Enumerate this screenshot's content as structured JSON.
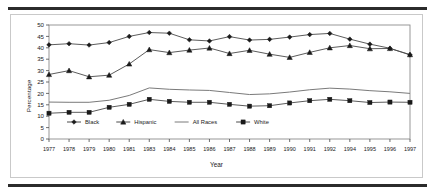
{
  "figure": {
    "rules": {
      "color": "#2b2b2b"
    },
    "border_color": "#c9c9c9"
  },
  "chart_data": {
    "type": "line",
    "title": "",
    "xlabel": "Year",
    "ylabel": "Percentage",
    "ylim": [
      0,
      50
    ],
    "ytick_step": 5,
    "yticks": [
      "0",
      "5",
      "10",
      "15",
      "20",
      "25",
      "30",
      "35",
      "40",
      "45",
      "50"
    ],
    "grid": false,
    "legend_position": "inside-bottom-left",
    "categories": [
      "1977",
      "1978",
      "1979",
      "1980",
      "1981",
      "1983",
      "1984",
      "1985",
      "1986",
      "1987",
      "1988",
      "1989",
      "1990",
      "1991",
      "1992",
      "1994",
      "1995",
      "1996",
      "1997"
    ],
    "series": [
      {
        "name": "Black",
        "marker": "diamond",
        "color": "#1a1a1a",
        "values": [
          41.3,
          41.8,
          41.2,
          42.3,
          45.0,
          46.7,
          46.4,
          43.5,
          43.0,
          44.9,
          43.4,
          43.7,
          44.7,
          45.8,
          46.3,
          43.8,
          41.6,
          39.8,
          36.9
        ]
      },
      {
        "name": "Hispanic",
        "marker": "triangle",
        "color": "#1a1a1a",
        "values": [
          28.3,
          30.0,
          27.3,
          28.0,
          32.9,
          39.2,
          37.9,
          39.0,
          39.9,
          37.5,
          38.9,
          37.2,
          35.8,
          38.0,
          40.0,
          41.0,
          39.6,
          39.7,
          37.0
        ]
      },
      {
        "name": "All Races",
        "marker": "none",
        "color": "#7a7a7a",
        "values": [
          16.2,
          16.1,
          16.1,
          17.0,
          19.1,
          22.4,
          21.8,
          21.5,
          21.3,
          20.4,
          19.5,
          19.8,
          20.6,
          21.6,
          22.3,
          21.9,
          21.2,
          20.7,
          20.0
        ]
      },
      {
        "name": "White",
        "marker": "square",
        "color": "#1a1a1a",
        "values": [
          11.3,
          11.7,
          11.7,
          13.9,
          15.2,
          17.4,
          16.5,
          16.1,
          16.1,
          15.2,
          14.4,
          14.6,
          15.8,
          16.8,
          17.4,
          16.8,
          16.0,
          16.2,
          16.1
        ]
      }
    ]
  }
}
